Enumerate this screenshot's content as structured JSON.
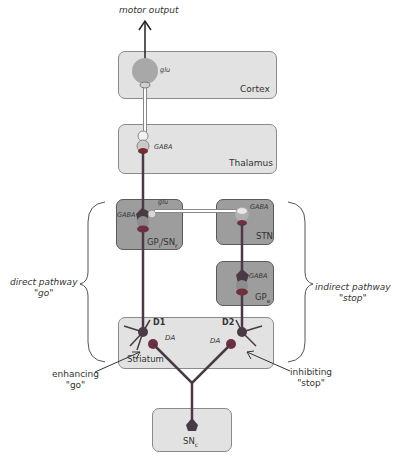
{
  "diagram": {
    "output_label": "motor output",
    "nodes": {
      "cortex": {
        "label": "Cortex",
        "transmitter": "glu",
        "sign": "+"
      },
      "thalamus": {
        "label": "Thalamus",
        "transmitter": "GABA",
        "sign": "−"
      },
      "gpi_snr": {
        "label": "GPi/SNr",
        "label_main": "GP",
        "sub1": "i",
        "mid": "/SN",
        "sub2": "r",
        "transmitter_top": "glu",
        "transmitter_left": "GABA",
        "sign_top": "+",
        "sign_left": "−"
      },
      "stn": {
        "label": "STN",
        "transmitter": "GABA",
        "sign": "−"
      },
      "gpe": {
        "label": "GPe",
        "label_main": "GP",
        "sub": "e",
        "transmitter": "GABA",
        "sign": "−"
      },
      "striatum": {
        "label": "Striatum",
        "d1": "D1",
        "d2": "D2",
        "transmitter_left": "DA",
        "transmitter_right": "DA",
        "sign_d1": "+",
        "sign_d2": "−"
      },
      "snc": {
        "label": "SNc",
        "label_main": "SN",
        "sub": "c"
      }
    },
    "pathways": {
      "direct": {
        "line1": "direct pathway",
        "line2": "\"go\""
      },
      "indirect": {
        "line1": "indirect pathway",
        "line2": "\"stop\""
      }
    },
    "annotations": {
      "enhancing": {
        "line1": "enhancing",
        "line2": "\"go\""
      },
      "inhibiting": {
        "line1": "inhibiting",
        "line2": "\"stop\""
      }
    },
    "colors": {
      "light_box": "#e2e2e2",
      "dark_box": "#9d9d9d",
      "axon": "#4a3a45",
      "neuron": "#6a5a66"
    }
  }
}
